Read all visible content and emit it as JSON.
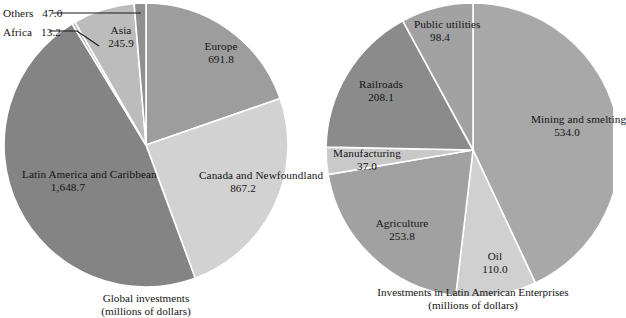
{
  "figure": {
    "background": "#ffffff",
    "text_color": "#141414",
    "slice_border": "#ffffff"
  },
  "chart_data": [
    {
      "type": "pie",
      "id": "global-investments",
      "title": "Global investments",
      "subtitle": "(millions of dollars)",
      "units": "millions of dollars",
      "total": 3513.8,
      "start_angle_deg": 0,
      "direction": "clockwise",
      "center": {
        "x": 146,
        "y": 145
      },
      "radius": 142,
      "legend": "none",
      "grid": false,
      "categories": [
        "Europe",
        "Canada and Newfoundland",
        "Latin America and Caribbean",
        "Africa",
        "Asia",
        "Others"
      ],
      "values": [
        691.8,
        867.2,
        1648.7,
        13.2,
        245.9,
        47.0
      ],
      "slices": [
        {
          "label_line1": "Europe",
          "value_text": "691.8",
          "value": 691.8,
          "color": "#9d9d9d",
          "label_mode": "inside",
          "label_left": 191,
          "label_top": 40
        },
        {
          "label_line1": "Canada and",
          "label_line2": "Newfoundland",
          "value_text": "867.2",
          "value": 867.2,
          "color": "#d2d2d2",
          "label_mode": "inside",
          "label_left": 199,
          "label_top": 169
        },
        {
          "label_line1": "Latin America",
          "label_line2": "and Caribbean",
          "value_text": "1,648.7",
          "value": 1648.7,
          "color": "#848484",
          "label_mode": "inside",
          "label_left": 22,
          "label_top": 168
        },
        {
          "label_line1": "Africa",
          "value_text": "13.2",
          "value": 13.2,
          "color": "#b4b4b4",
          "label_mode": "leader",
          "label_left": 3,
          "label_top": 26
        },
        {
          "label_line1": "Asia",
          "value_text": "245.9",
          "value": 245.9,
          "color": "#bcbcbc",
          "label_mode": "inside",
          "label_left": 95,
          "label_top": 24
        },
        {
          "label_line1": "Others",
          "value_text": "47.0",
          "value": 47.0,
          "color": "#8f8f8f",
          "label_mode": "leader",
          "label_left": 3,
          "label_top": 7
        }
      ],
      "caption_left": 146,
      "caption_top": 292
    },
    {
      "type": "pie",
      "id": "latin-american-enterprises",
      "title": "Investments in Latin American Enterprises",
      "subtitle": "(millions of dollars)",
      "units": "millions of dollars",
      "total": 1241.3,
      "start_angle_deg": 0,
      "direction": "clockwise",
      "center": {
        "x": 473,
        "y": 150
      },
      "radius": 147,
      "legend": "none",
      "grid": false,
      "categories": [
        "Mining and smelting",
        "Oil",
        "Agriculture",
        "Manufacturing",
        "Railroads",
        "Public utilities"
      ],
      "values": [
        534.0,
        110.0,
        253.8,
        37.0,
        208.1,
        98.4
      ],
      "slices": [
        {
          "label_line1": "Mining and",
          "label_line2": "smelting",
          "value_text": "534.0",
          "value": 534.0,
          "color": "#a8a8a8",
          "label_mode": "inside",
          "label_left": 565,
          "label_top": 113
        },
        {
          "label_line1": "Oil",
          "value_text": "110.0",
          "value": 110.0,
          "color": "#d0d0d0",
          "label_mode": "inside",
          "label_left": 487,
          "label_top": 250
        },
        {
          "label_line1": "Agriculture",
          "value_text": "253.8",
          "value": 253.8,
          "color": "#a1a1a1",
          "label_mode": "inside",
          "label_left": 394,
          "label_top": 217
        },
        {
          "label_line1": "Manufacturing",
          "value_text": "37.0",
          "value": 37.0,
          "color": "#c9c9c9",
          "label_mode": "inside",
          "label_left": 366,
          "label_top": 147
        },
        {
          "label_line1": "Railroads",
          "value_text": "208.1",
          "value": 208.1,
          "color": "#8b8b8b",
          "label_mode": "inside",
          "label_left": 378,
          "label_top": 78
        },
        {
          "label_line1": "Public",
          "label_line2": "utilities",
          "value_text": "98.4",
          "value": 98.4,
          "color": "#a2a2a2",
          "label_mode": "inside",
          "label_left": 440,
          "label_top": 18
        }
      ],
      "caption_left": 473,
      "caption_top": 286
    }
  ]
}
